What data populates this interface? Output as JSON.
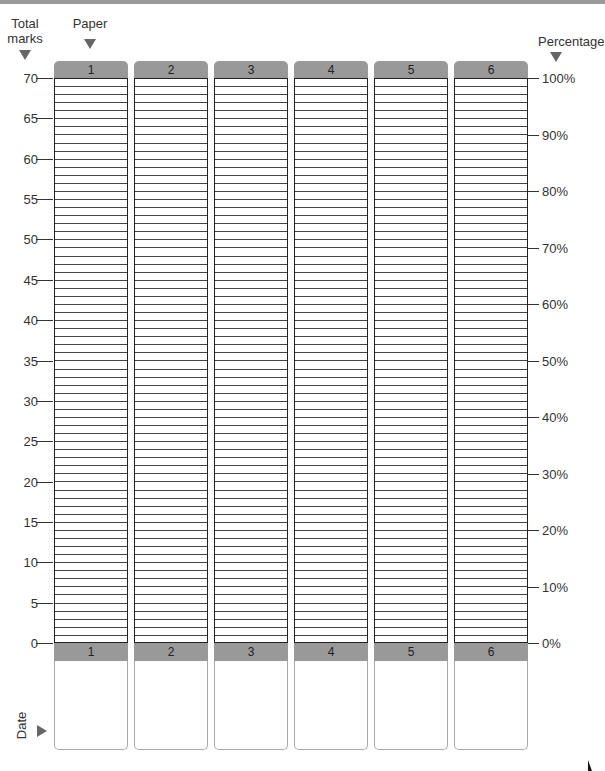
{
  "header": {
    "total_marks_label_line1": "Total",
    "total_marks_label_line2": "marks",
    "paper_label": "Paper",
    "percentage_label": "Percentage"
  },
  "footer": {
    "date_label": "Date"
  },
  "papers": [
    "1",
    "2",
    "3",
    "4",
    "5",
    "6"
  ],
  "left_axis": [
    "70",
    "65",
    "60",
    "55",
    "50",
    "45",
    "40",
    "35",
    "30",
    "25",
    "20",
    "15",
    "10",
    "5",
    "0"
  ],
  "right_axis": [
    "100%",
    "90%",
    "80%",
    "70%",
    "60%",
    "50%",
    "40%",
    "30%",
    "20%",
    "10%",
    "0%"
  ],
  "colors": {
    "tab_fill": "#999999",
    "grid_line": "#444444",
    "column_border": "#222222",
    "arrow": "#666666"
  },
  "chart_data": {
    "type": "bar",
    "title": "",
    "categories": [
      "Paper 1",
      "Paper 2",
      "Paper 3",
      "Paper 4",
      "Paper 5",
      "Paper 6"
    ],
    "values": [
      null,
      null,
      null,
      null,
      null,
      null
    ],
    "xlabel": "Paper",
    "ylabel": "Total marks",
    "ylabel_right": "Percentage",
    "ylim": [
      0,
      70
    ],
    "ylim_right": [
      0,
      100
    ],
    "yticks": [
      0,
      5,
      10,
      15,
      20,
      25,
      30,
      35,
      40,
      45,
      50,
      55,
      60,
      65,
      70
    ],
    "yticks_right": [
      "0%",
      "10%",
      "20%",
      "30%",
      "40%",
      "50%",
      "60%",
      "70%",
      "80%",
      "90%",
      "100%"
    ],
    "grid": "one horizontal line per mark (70 rows per column)",
    "footer_row": "Date",
    "note": "Blank progress-tracking template; no values filled in"
  }
}
